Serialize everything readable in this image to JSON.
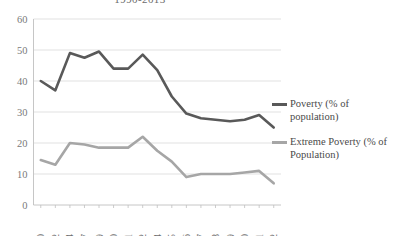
{
  "chart_data": {
    "type": "line",
    "title": "1990-2013",
    "xlabel": "",
    "ylabel": "",
    "ylim": [
      0,
      60
    ],
    "ytick_step": 10,
    "yticks": [
      0,
      10,
      20,
      30,
      40,
      50,
      60
    ],
    "grid": true,
    "legend_position": "right",
    "categories": [
      "990",
      "992",
      "994",
      "997",
      "999",
      "000",
      "001",
      "002",
      "004",
      "005",
      "006",
      "007",
      "008",
      "009",
      "010",
      "011",
      "012"
    ],
    "series": [
      {
        "name": "Poverty (% of population)",
        "color": "#595959",
        "values": [
          40.0,
          37.0,
          49.0,
          47.5,
          49.5,
          44.0,
          44.0,
          48.5,
          43.5,
          35.0,
          29.5,
          28.0,
          27.5,
          27.0,
          27.5,
          29.0,
          25.0
        ]
      },
      {
        "name": "Extreme Poverty (% of Population)",
        "color": "#a6a6a6",
        "values": [
          14.5,
          13.0,
          20.0,
          19.5,
          18.5,
          18.5,
          18.5,
          22.0,
          17.5,
          14.0,
          9.0,
          10.0,
          10.0,
          10.0,
          10.5,
          11.0,
          7.0
        ]
      }
    ]
  },
  "legend": {
    "entries": [
      {
        "label": "Poverty (% of population)",
        "color": "#595959"
      },
      {
        "label": "Extreme Poverty (% of Population)",
        "color": "#a6a6a6"
      }
    ]
  }
}
